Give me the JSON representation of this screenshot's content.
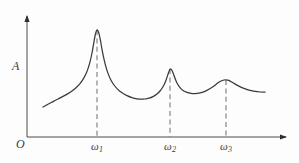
{
  "figure": {
    "background_color": "#fdfdfd",
    "line_color": "#3a3a3a",
    "dash_color": "#6d6d6d"
  },
  "axes": {
    "origin_label": "O",
    "y_axis_label": "A",
    "x_axis_ticks": [
      {
        "name": "omega-1",
        "symbol": "ω",
        "subscript": "1"
      },
      {
        "name": "omega-2",
        "symbol": "ω",
        "subscript": "2"
      },
      {
        "name": "omega-3",
        "symbol": "ω",
        "subscript": "3"
      }
    ]
  },
  "chart_data": {
    "type": "line",
    "title": "",
    "xlabel": "ω",
    "ylabel": "A",
    "grid": false,
    "legend": null,
    "axis_style": {
      "x_axis": {
        "arrow": true,
        "y_pixel": 137,
        "x_start_pixel": 27,
        "x_end_pixel": 290
      },
      "y_axis": {
        "arrow": true,
        "x_pixel": 27,
        "y_start_pixel": 137,
        "y_end_pixel": 11
      }
    },
    "tick_positions_px": [
      97,
      170,
      226
    ],
    "resonance_peaks": [
      {
        "label": "ω₁",
        "x_px": 97,
        "peak_y_px": 30,
        "amplitude_rel": 1.0,
        "width_rel": 0.25
      },
      {
        "label": "ω₂",
        "x_px": 170,
        "peak_y_px": 69,
        "amplitude_rel": 0.64,
        "width_rel": 0.36
      },
      {
        "label": "ω₃",
        "x_px": 226,
        "peak_y_px": 80,
        "amplitude_rel": 0.53,
        "width_rel": 0.46
      }
    ],
    "curve_points_px": [
      [
        43,
        107
      ],
      [
        48,
        104.2
      ],
      [
        53,
        101.6
      ],
      [
        58,
        99.0
      ],
      [
        63,
        96.4
      ],
      [
        68,
        93.6
      ],
      [
        72,
        91.0
      ],
      [
        76,
        87.8
      ],
      [
        80,
        83.6
      ],
      [
        83,
        79.4
      ],
      [
        86,
        73.8
      ],
      [
        88,
        68.6
      ],
      [
        90,
        61.8
      ],
      [
        92,
        53.0
      ],
      [
        93.5,
        44.6
      ],
      [
        95,
        36.0
      ],
      [
        96.2,
        31.4
      ],
      [
        97,
        30.0
      ],
      [
        97.8,
        30.6
      ],
      [
        99,
        33.6
      ],
      [
        100.5,
        40.6
      ],
      [
        102,
        49.4
      ],
      [
        104,
        59.2
      ],
      [
        106,
        67.2
      ],
      [
        108,
        73.4
      ],
      [
        111,
        80.2
      ],
      [
        114,
        85.0
      ],
      [
        118,
        89.6
      ],
      [
        122,
        92.8
      ],
      [
        127,
        95.6
      ],
      [
        132,
        97.6
      ],
      [
        137,
        98.8
      ],
      [
        141,
        99.2
      ],
      [
        145,
        99.0
      ],
      [
        149,
        98.2
      ],
      [
        153,
        96.6
      ],
      [
        157,
        94.0
      ],
      [
        160,
        91.0
      ],
      [
        163,
        86.8
      ],
      [
        165,
        82.8
      ],
      [
        167,
        77.4
      ],
      [
        168.5,
        72.8
      ],
      [
        170,
        69.2
      ],
      [
        171.5,
        69.6
      ],
      [
        173,
        72.8
      ],
      [
        175,
        78.2
      ],
      [
        177,
        83.0
      ],
      [
        180,
        87.6
      ],
      [
        183,
        90.4
      ],
      [
        187,
        92.4
      ],
      [
        191,
        93.4
      ],
      [
        195,
        93.6
      ],
      [
        199,
        93.2
      ],
      [
        203,
        92.2
      ],
      [
        207,
        90.4
      ],
      [
        211,
        88.0
      ],
      [
        215,
        85.2
      ],
      [
        218,
        82.8
      ],
      [
        221,
        81.0
      ],
      [
        224,
        80.0
      ],
      [
        226,
        79.8
      ],
      [
        228,
        80.2
      ],
      [
        231,
        81.6
      ],
      [
        234,
        83.4
      ],
      [
        238,
        85.6
      ],
      [
        242,
        87.6
      ],
      [
        246,
        89.2
      ],
      [
        250,
        90.4
      ],
      [
        255,
        91.4
      ],
      [
        260,
        92.0
      ],
      [
        265,
        92.2
      ]
    ],
    "dashed_drop_lines": [
      {
        "x_px": 97,
        "y_top_px": 30,
        "y_bottom_px": 137
      },
      {
        "x_px": 170,
        "y_top_px": 69,
        "y_bottom_px": 137
      },
      {
        "x_px": 226,
        "y_top_px": 80,
        "y_bottom_px": 137
      }
    ]
  }
}
